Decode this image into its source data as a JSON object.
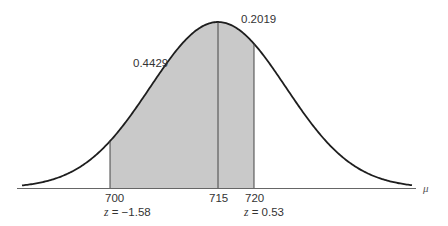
{
  "chart_data": {
    "type": "area",
    "title": "",
    "distribution": {
      "mean": 715,
      "sigma": 9.43
    },
    "xlabel": "μ",
    "ylabel": "",
    "x_ticks": [
      {
        "value": 700,
        "label": "700",
        "z_label": "z = −1.58"
      },
      {
        "value": 715,
        "label": "715",
        "z_label": ""
      },
      {
        "value": 720,
        "label": "720",
        "z_label": "z = 0.53"
      }
    ],
    "shaded_regions": [
      {
        "from": 700,
        "to": 715,
        "area": 0.4429,
        "label": "0.4429"
      },
      {
        "from": 715,
        "to": 720,
        "area": 0.2019,
        "label": "0.2019"
      }
    ],
    "grid": false,
    "colors": {
      "curve": "#1e1e1e",
      "fill": "#c8c8c8",
      "axis": "#555555"
    }
  },
  "labels": {
    "area_left": "0.4429",
    "area_right": "0.2019",
    "tick_700": "700",
    "tick_715": "715",
    "tick_720": "720",
    "z_700_prefix": "z",
    "z_700_value": " = −1.58",
    "z_720_prefix": "z",
    "z_720_value": " = 0.53",
    "axis_symbol": "μ"
  }
}
